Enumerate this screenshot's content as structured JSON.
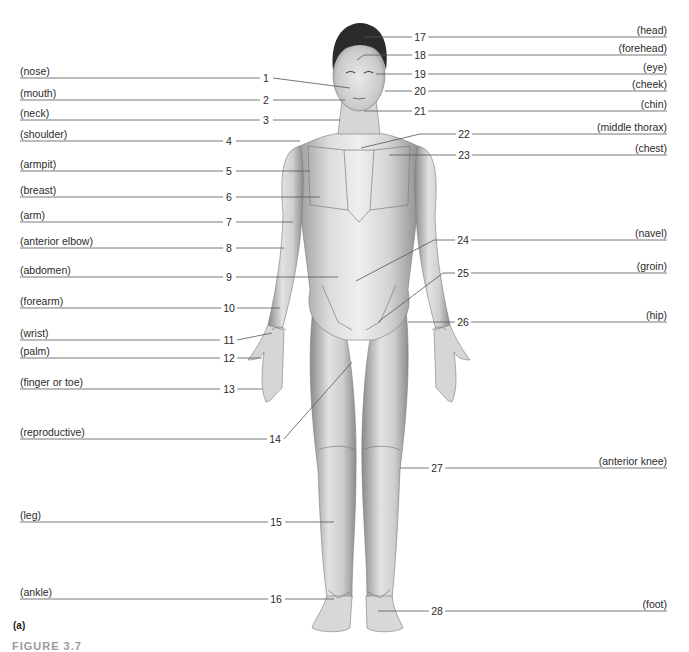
{
  "panel_label": "(a)",
  "caption_partial": "FIGURE 3.7",
  "style": {
    "line_color": "#5a5a5a",
    "skin_light": "#e9e9e9",
    "skin_dark": "#a8a8a8",
    "hair": "#2b2b2b"
  },
  "left_labels": [
    {
      "num": "1",
      "term": "(nose)",
      "y": 78,
      "num_x": 266
    },
    {
      "num": "2",
      "term": "(mouth)",
      "y": 100,
      "num_x": 266
    },
    {
      "num": "3",
      "term": "(neck)",
      "y": 120,
      "num_x": 266
    },
    {
      "num": "4",
      "term": "(shoulder)",
      "y": 141,
      "num_x": 229
    },
    {
      "num": "5",
      "term": "(armpit)",
      "y": 171,
      "num_x": 229
    },
    {
      "num": "6",
      "term": "(breast)",
      "y": 197,
      "num_x": 229
    },
    {
      "num": "7",
      "term": "(arm)",
      "y": 222,
      "num_x": 229
    },
    {
      "num": "8",
      "term": "(anterior elbow)",
      "y": 248,
      "num_x": 229
    },
    {
      "num": "9",
      "term": "(abdomen)",
      "y": 277,
      "num_x": 229
    },
    {
      "num": "10",
      "term": "(forearm)",
      "y": 308,
      "num_x": 229
    },
    {
      "num": "11",
      "term": "(wrist)",
      "y": 340,
      "num_x": 229
    },
    {
      "num": "12",
      "term": "(palm)",
      "y": 358,
      "num_x": 229
    },
    {
      "num": "13",
      "term": "(finger or toe)",
      "y": 389,
      "num_x": 229
    },
    {
      "num": "14",
      "term": "(reproductive)",
      "y": 439,
      "num_x": 275
    },
    {
      "num": "15",
      "term": "(leg)",
      "y": 522,
      "num_x": 276
    },
    {
      "num": "16",
      "term": "(ankle)",
      "y": 599,
      "num_x": 276
    }
  ],
  "right_labels": [
    {
      "num": "17",
      "term": "(head)",
      "y": 37,
      "num_x": 420
    },
    {
      "num": "18",
      "term": "(forehead)",
      "y": 55,
      "num_x": 420
    },
    {
      "num": "19",
      "term": "(eye)",
      "y": 74,
      "num_x": 420
    },
    {
      "num": "20",
      "term": "(cheek)",
      "y": 91,
      "num_x": 420
    },
    {
      "num": "21",
      "term": "(chin)",
      "y": 111,
      "num_x": 420
    },
    {
      "num": "22",
      "term": "(middle thorax)",
      "y": 134,
      "num_x": 464
    },
    {
      "num": "23",
      "term": "(chest)",
      "y": 155,
      "num_x": 464
    },
    {
      "num": "24",
      "term": "(navel)",
      "y": 240,
      "num_x": 463
    },
    {
      "num": "25",
      "term": "(groin)",
      "y": 273,
      "num_x": 463
    },
    {
      "num": "26",
      "term": "(hip)",
      "y": 322,
      "num_x": 463
    },
    {
      "num": "27",
      "term": "(anterior knee)",
      "y": 468,
      "num_x": 437
    },
    {
      "num": "28",
      "term": "(foot)",
      "y": 611,
      "num_x": 437
    }
  ]
}
